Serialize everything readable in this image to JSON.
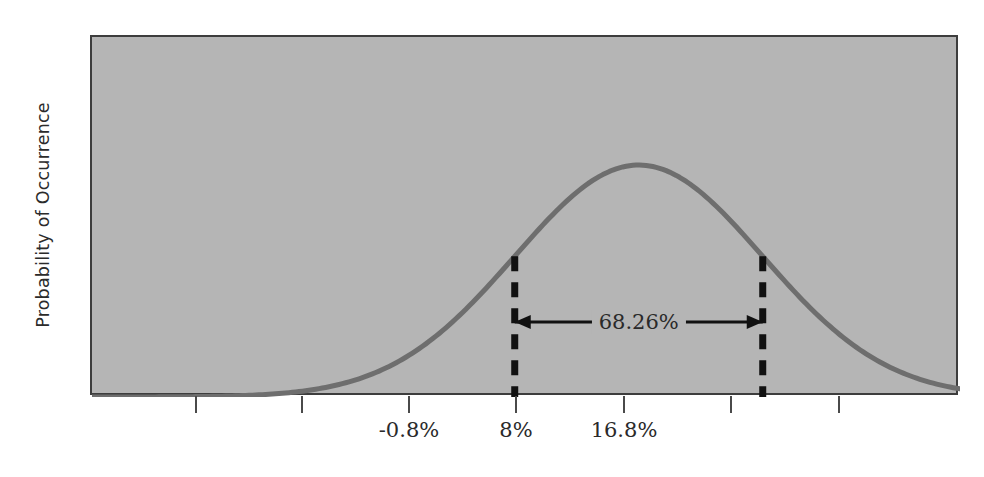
{
  "chart_data": {
    "type": "line",
    "title": "",
    "subtitle": "",
    "xlabel": "",
    "ylabel": "Probability of Occurrence",
    "distribution": "normal",
    "mean": 8,
    "sigma": 8.8,
    "mean_label": "8%",
    "minus_one_sigma_label": "-0.8%",
    "plus_one_sigma_label": "16.8%",
    "grid": false,
    "legend": null,
    "xtick_positions": [
      -26.4,
      -17.6,
      -8.8,
      0,
      8.8,
      17.6,
      26.4
    ],
    "xtick_labels": [
      "",
      "",
      "-0.8%",
      "8%",
      "16.8%",
      "",
      ""
    ],
    "xtick_labels_visible": [
      "-0.8%",
      "8%",
      "16.8%"
    ],
    "xlim": [
      -30.8,
      30.8
    ],
    "ylim": [
      0,
      1.06
    ],
    "annotations": [
      {
        "name": "one-sigma-span",
        "text": "68.26%",
        "from_x": -8.8,
        "to_x": 8.8,
        "style": "double-headed-arrow"
      }
    ],
    "series": [
      {
        "name": "probability-density",
        "x": [
          -30.8,
          -28.6,
          -26.4,
          -24.2,
          -22.0,
          -19.8,
          -17.6,
          -15.4,
          -13.2,
          -11.0,
          -8.8,
          -6.6,
          -4.4,
          -2.2,
          0,
          2.2,
          4.4,
          6.6,
          8.8,
          11.0,
          13.2,
          15.4,
          17.6,
          19.8,
          22.0,
          24.2,
          26.4,
          28.6,
          30.8
        ],
        "y": [
          0.039,
          0.05,
          0.065,
          0.082,
          0.105,
          0.133,
          0.167,
          0.208,
          0.256,
          0.313,
          0.378,
          0.45,
          0.527,
          0.606,
          0.683,
          0.606,
          0.527,
          0.45,
          0.378,
          0.313,
          0.256,
          0.208,
          0.167,
          0.133,
          0.105,
          0.082,
          0.065,
          0.05,
          0.039
        ]
      }
    ]
  },
  "axis": {
    "y_title": "Probability of Occurrence",
    "ticks": [
      {
        "label": "",
        "pos_px": 196
      },
      {
        "label": "",
        "pos_px": 302
      },
      {
        "label": "-0.8%",
        "pos_px": 409
      },
      {
        "label": "8%",
        "pos_px": 516
      },
      {
        "label": "16.8%",
        "pos_px": 624
      },
      {
        "label": "",
        "pos_px": 731
      },
      {
        "label": "",
        "pos_px": 839
      }
    ]
  },
  "annotation": {
    "span_label": "68.26%"
  },
  "colors": {
    "panel_background": "#b5b5b5",
    "panel_border": "#3d3d3d",
    "curve": "#6e6e6e",
    "marker_line": "#111111",
    "text": "#2a2a2a",
    "tick": "#4a4a4a",
    "page_background": "#ffffff"
  }
}
